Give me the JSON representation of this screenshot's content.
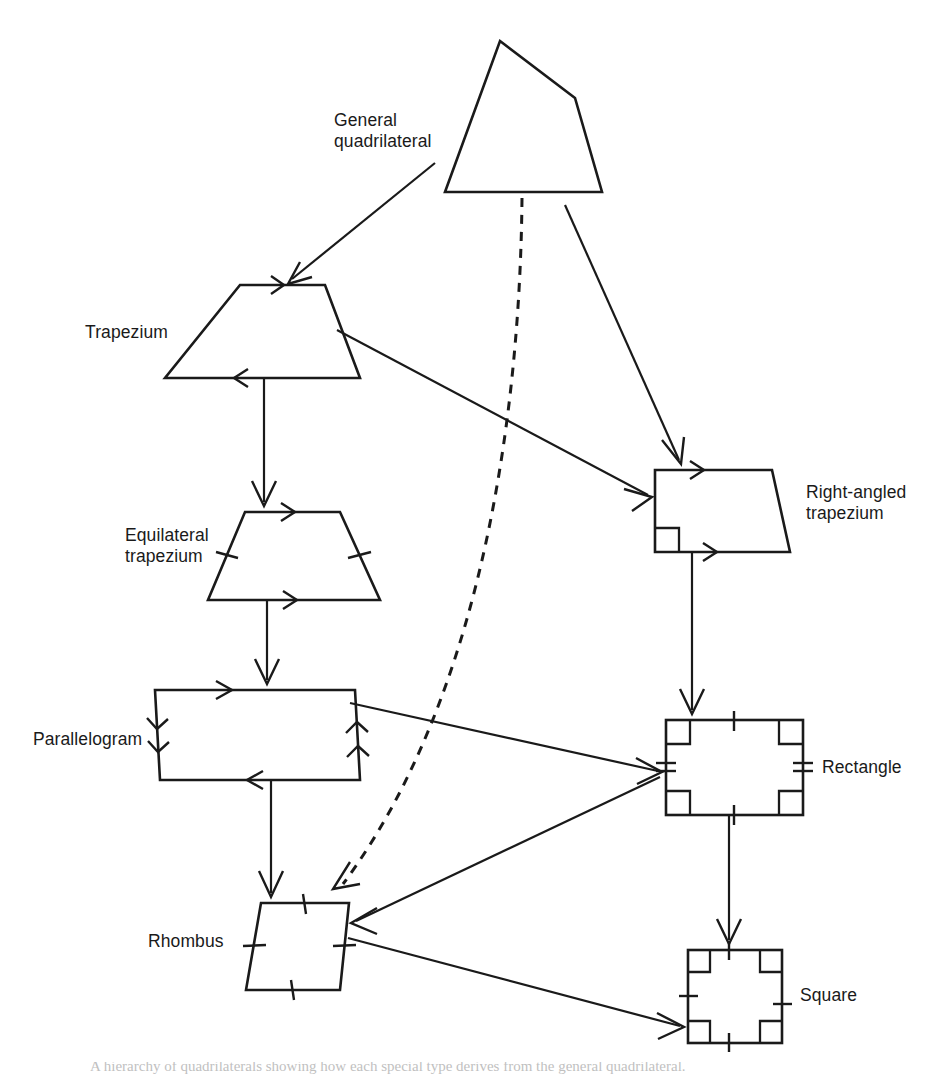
{
  "figure": {
    "background_color": "#ffffff",
    "ink_color": "#1a1a1a",
    "width": 940,
    "height": 1076,
    "caption": "A hierarchy of quadrilaterals showing how each special type derives from the general quadrilateral."
  },
  "labels": {
    "general_quadrilateral": "General\nquadrilateral",
    "trapezium": "Trapezium",
    "equilateral_trapezium": "Equilateral\ntrapezium",
    "parallelogram": "Parallelogram",
    "rhombus": "Rhombus",
    "right_angled_trapezium": "Right-angled\ntrapezium",
    "rectangle": "Rectangle",
    "square": "Square"
  },
  "nodes": [
    {
      "id": "general-quadrilateral",
      "label": "General quadrilateral",
      "shape": "irregular-quadrilateral",
      "vertices": [
        [
          500,
          41
        ],
        [
          575,
          98
        ],
        [
          602,
          192
        ],
        [
          445,
          192
        ]
      ],
      "marks": {
        "parallel_arrows": 0,
        "equal_ticks": 0,
        "right_angles": 0
      }
    },
    {
      "id": "trapezium",
      "label": "Trapezium",
      "shape": "trapezium",
      "vertices": [
        [
          240,
          285
        ],
        [
          325,
          285
        ],
        [
          360,
          378
        ],
        [
          165,
          378
        ]
      ],
      "marks": {
        "parallel_arrows": 2,
        "equal_ticks": 0,
        "right_angles": 0
      }
    },
    {
      "id": "equilateral-trapezium",
      "label": "Equilateral trapezium",
      "shape": "isosceles-trapezium",
      "vertices": [
        [
          245,
          512
        ],
        [
          340,
          512
        ],
        [
          380,
          600
        ],
        [
          208,
          600
        ]
      ],
      "marks": {
        "parallel_arrows": 2,
        "equal_ticks": 2,
        "right_angles": 0
      }
    },
    {
      "id": "parallelogram",
      "label": "Parallelogram",
      "shape": "parallelogram",
      "vertices": [
        [
          155,
          690
        ],
        [
          355,
          690
        ],
        [
          360,
          780
        ],
        [
          160,
          780
        ]
      ],
      "marks": {
        "parallel_arrows": 4,
        "equal_ticks": 0,
        "right_angles": 0
      }
    },
    {
      "id": "rhombus",
      "label": "Rhombus",
      "shape": "rhombus",
      "vertices": [
        [
          261,
          903
        ],
        [
          349,
          903
        ],
        [
          340,
          990
        ],
        [
          246,
          990
        ]
      ],
      "marks": {
        "parallel_arrows": 0,
        "equal_ticks": 4,
        "right_angles": 0
      }
    },
    {
      "id": "right-angled-trapezium",
      "label": "Right-angled trapezium",
      "shape": "right-trapezium",
      "vertices": [
        [
          655,
          470
        ],
        [
          772,
          470
        ],
        [
          790,
          552
        ],
        [
          655,
          552
        ]
      ],
      "marks": {
        "parallel_arrows": 2,
        "equal_ticks": 0,
        "right_angles": 1
      }
    },
    {
      "id": "rectangle",
      "label": "Rectangle",
      "shape": "rectangle",
      "vertices": [
        [
          666,
          720
        ],
        [
          803,
          720
        ],
        [
          803,
          815
        ],
        [
          666,
          815
        ]
      ],
      "marks": {
        "parallel_arrows": 0,
        "equal_ticks": 4,
        "right_angles": 4
      }
    },
    {
      "id": "square",
      "label": "Square",
      "shape": "square",
      "vertices": [
        [
          688,
          950
        ],
        [
          782,
          950
        ],
        [
          782,
          1043
        ],
        [
          688,
          1043
        ]
      ],
      "marks": {
        "parallel_arrows": 0,
        "equal_ticks": 4,
        "right_angles": 4
      }
    }
  ],
  "edges": [
    {
      "id": "gq-to-trapezium",
      "from": "general-quadrilateral",
      "to": "trapezium",
      "style": "solid"
    },
    {
      "id": "gq-to-rat",
      "from": "general-quadrilateral",
      "to": "right-angled-trapezium",
      "style": "solid"
    },
    {
      "id": "gq-to-rhombus",
      "from": "general-quadrilateral",
      "to": "rhombus",
      "style": "dashed"
    },
    {
      "id": "trapezium-to-eqtrap",
      "from": "trapezium",
      "to": "equilateral-trapezium",
      "style": "solid"
    },
    {
      "id": "trapezium-to-rat",
      "from": "trapezium",
      "to": "right-angled-trapezium",
      "style": "solid"
    },
    {
      "id": "eqtrap-to-parallelogram",
      "from": "equilateral-trapezium",
      "to": "parallelogram",
      "style": "solid"
    },
    {
      "id": "parallelogram-to-rhombus",
      "from": "parallelogram",
      "to": "rhombus",
      "style": "solid"
    },
    {
      "id": "parallelogram-to-rectangle",
      "from": "parallelogram",
      "to": "rectangle",
      "style": "solid"
    },
    {
      "id": "rat-to-rectangle",
      "from": "right-angled-trapezium",
      "to": "rectangle",
      "style": "solid"
    },
    {
      "id": "rectangle-to-rhombus",
      "from": "rectangle",
      "to": "rhombus",
      "style": "solid"
    },
    {
      "id": "rectangle-to-square",
      "from": "rectangle",
      "to": "square",
      "style": "solid"
    },
    {
      "id": "rhombus-to-square",
      "from": "rhombus",
      "to": "square",
      "style": "solid"
    }
  ]
}
